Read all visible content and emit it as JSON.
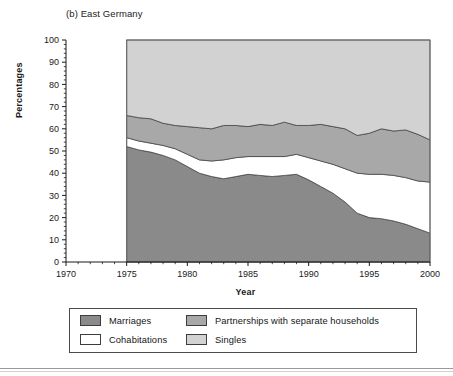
{
  "figure": {
    "panel_title": "(b) East Germany",
    "ylabel": "Percentages",
    "xlabel": "Year"
  },
  "legend": {
    "items": [
      {
        "label": "Marriages",
        "color": "#8a8a8a"
      },
      {
        "label": "Partnerships with separate households",
        "color": "#a8a8a8"
      },
      {
        "label": "Cohabitations",
        "color": "#ffffff"
      },
      {
        "label": "Singles",
        "color": "#d2d2d2"
      }
    ]
  },
  "chart_data": {
    "type": "area",
    "title": "(b) East Germany",
    "subtitle": "",
    "xlabel": "Year",
    "ylabel": "Percentages",
    "xlim": [
      1970,
      2000
    ],
    "ylim": [
      0,
      100
    ],
    "xticks": [
      1970,
      1975,
      1980,
      1985,
      1990,
      1995,
      2000
    ],
    "yticks": [
      0,
      10,
      20,
      30,
      40,
      50,
      60,
      70,
      80,
      90,
      100
    ],
    "minor_ticks": true,
    "grid": false,
    "stacked": true,
    "legend_position": "below",
    "data_start_year": 1975,
    "x": [
      1975,
      1976,
      1977,
      1978,
      1979,
      1980,
      1981,
      1982,
      1983,
      1984,
      1985,
      1986,
      1987,
      1988,
      1989,
      1990,
      1991,
      1992,
      1993,
      1994,
      1995,
      1996,
      1997,
      1998,
      1999,
      2000
    ],
    "series": [
      {
        "name": "Marriages",
        "color": "#8a8a8a",
        "values": [
          52,
          50.5,
          49.5,
          48,
          46,
          43,
          40,
          38.5,
          37.5,
          38.5,
          39.5,
          39,
          38.5,
          39,
          39.5,
          37,
          34,
          31,
          27,
          22,
          20,
          19.5,
          18.5,
          17,
          15,
          13
        ]
      },
      {
        "name": "Cohabitations",
        "color": "#ffffff",
        "values": [
          4,
          4,
          4,
          4.5,
          5,
          5.5,
          6,
          7,
          8.5,
          8.5,
          8,
          8.5,
          9,
          8.5,
          9,
          10,
          11.5,
          13,
          15,
          18,
          19.5,
          20,
          20.5,
          21,
          21.5,
          23
        ]
      },
      {
        "name": "Partnerships with separate households",
        "color": "#a8a8a8",
        "values": [
          10,
          10.5,
          11,
          10,
          10.5,
          12.5,
          14.5,
          14.5,
          15.5,
          14.5,
          13.5,
          14.5,
          14,
          15.5,
          13,
          14.5,
          16.5,
          17,
          18,
          17,
          18.5,
          20.5,
          20,
          21.5,
          21,
          19
        ]
      },
      {
        "name": "Singles",
        "color": "#d2d2d2",
        "values": [
          34,
          35,
          35.5,
          37.5,
          38.5,
          39,
          39.5,
          40,
          38.5,
          38.5,
          39,
          38,
          38.5,
          37,
          38.5,
          38.5,
          38,
          39,
          40,
          43,
          42,
          40,
          41,
          40.5,
          42.5,
          45
        ]
      }
    ],
    "cumulative_tops": {
      "marriages": [
        52,
        50.5,
        49.5,
        48,
        46,
        43,
        40,
        38.5,
        37.5,
        38.5,
        39.5,
        39,
        38.5,
        39,
        39.5,
        37,
        34,
        31,
        27,
        22,
        20,
        19.5,
        18.5,
        17,
        15,
        13
      ],
      "cohabitations": [
        56,
        54.5,
        53.5,
        52.5,
        51,
        48.5,
        46,
        45.5,
        46,
        47,
        47.5,
        47.5,
        47.5,
        47.5,
        48.5,
        47,
        45.5,
        44,
        42,
        40,
        39.5,
        39.5,
        39,
        38,
        36.5,
        36
      ],
      "partnerships": [
        66,
        65,
        64.5,
        62.5,
        61.5,
        61,
        60.5,
        60,
        61.5,
        61.5,
        61,
        62,
        61.5,
        63,
        61.5,
        61.5,
        62,
        61,
        60,
        57,
        58,
        60,
        59,
        59.5,
        57.5,
        55
      ],
      "singles": [
        100,
        100,
        100,
        100,
        100,
        100,
        100,
        100,
        100,
        100,
        100,
        100,
        100,
        100,
        100,
        100,
        100,
        100,
        100,
        100,
        100,
        100,
        100,
        100,
        100,
        100
      ]
    }
  }
}
